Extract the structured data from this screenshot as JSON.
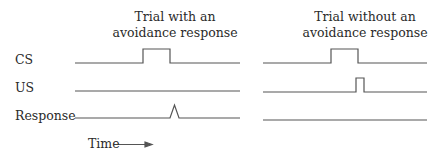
{
  "diagram": {
    "columns": [
      {
        "title_line1": "Trial with an",
        "title_line2": "avoidance response"
      },
      {
        "title_line1": "Trial without an",
        "title_line2": "avoidance response"
      }
    ],
    "rows": [
      {
        "label": "CS"
      },
      {
        "label": "US"
      },
      {
        "label": "Response"
      }
    ],
    "x_axis": {
      "label": "Time",
      "arrow": "right-arrow"
    },
    "traces": {
      "with_avoidance": {
        "CS": "step pulse on",
        "US": "flat (no US)",
        "Response": "brief spike during CS"
      },
      "without_avoidance": {
        "CS": "step pulse on",
        "US": "brief pulse at CS offset",
        "Response": "flat (no response)"
      }
    },
    "line_color": "#555555"
  }
}
